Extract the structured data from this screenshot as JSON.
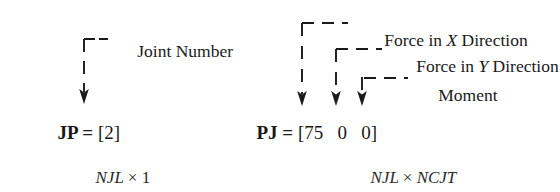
{
  "figure": {
    "background_color": "#ffffff",
    "ink_color": "#1a1a1a"
  },
  "left_group": {
    "name": "joint-load-position-vector",
    "equation": {
      "variable": "JP",
      "operator": "=",
      "value": "[2]"
    },
    "dimensions": {
      "rows": "NJL",
      "times": "×",
      "cols": "1"
    },
    "callouts": [
      {
        "label": "Joint Number",
        "points_to": "2"
      }
    ]
  },
  "right_group": {
    "name": "joint-load-magnitude-vector",
    "equation": {
      "variable": "PJ",
      "operator": "=",
      "open_bracket": "[",
      "values": [
        "75",
        "0",
        "0"
      ],
      "close_bracket": "]"
    },
    "dimensions": {
      "rows": "NJL",
      "times": "×",
      "cols": "NCJT"
    },
    "callouts": [
      {
        "label_prefix": "Force in ",
        "label_italic": "X",
        "label_suffix": " Direction",
        "points_to": "75"
      },
      {
        "label_prefix": "Force in ",
        "label_italic": "Y",
        "label_suffix": " Direction",
        "points_to": "0"
      },
      {
        "label_prefix": "Moment",
        "label_italic": "",
        "label_suffix": "",
        "points_to": "0"
      }
    ]
  }
}
